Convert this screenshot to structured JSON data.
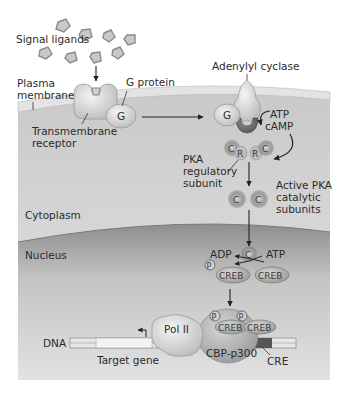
{
  "diagram": {
    "colors": {
      "background": "#ffffff",
      "extracellular": "#ffffff",
      "membrane": "#dcdcdc",
      "cytoplasm": "#d4d4d4",
      "nucleus": "#a9a9a9",
      "protein_light": "#e6e6e6",
      "protein_dark": "#8d8d8d",
      "dna": "#c0c0c0",
      "cre_region": "#555555",
      "text": "#2b2b2b"
    },
    "labels": {
      "signal_ligands": "Signal ligands",
      "plasma_membrane_1": "Plasma",
      "plasma_membrane_2": "membrane",
      "g_protein": "G protein",
      "g_letter": "G",
      "transmembrane_receptor_1": "Transmembrane",
      "transmembrane_receptor_2": "receptor",
      "adenylyl_cyclase": "Adenylyl cyclase",
      "atp": "ATP",
      "camp": "cAMP",
      "pka_regulatory_1": "PKA",
      "pka_regulatory_2": "regulatory",
      "pka_regulatory_3": "subunit",
      "c_letter": "C",
      "r_letter": "R",
      "active_pka_1": "Active PKA",
      "active_pka_2": "catalytic",
      "active_pka_3": "subunits",
      "cytoplasm": "Cytoplasm",
      "nucleus": "Nucleus",
      "adp": "ADP",
      "atp_2": "ATP",
      "p_letter": "P",
      "creb": "CREB",
      "dna": "DNA",
      "pol_ii": "Pol II",
      "target_gene": "Target gene",
      "cbp_p300": "CBP-p300",
      "cre": "CRE"
    }
  }
}
